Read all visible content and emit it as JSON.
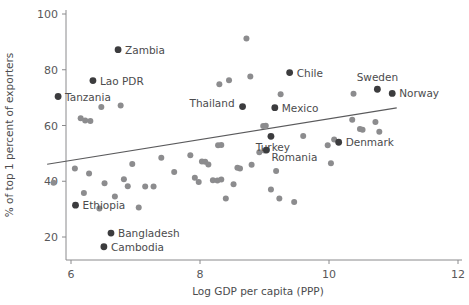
{
  "chart_data": {
    "type": "scatter",
    "title": "",
    "xlabel": "Log GDP per capita (PPP)",
    "ylabel": "% of top 1 percent of exporters",
    "xlim": [
      5.55,
      12.0
    ],
    "ylim": [
      13.5,
      100.0
    ],
    "xticks": [
      6,
      8,
      10,
      12
    ],
    "yticks": [
      20,
      40,
      60,
      80,
      100
    ],
    "grid": false,
    "legend": null,
    "colors": {
      "point_light": "#8c8c8e",
      "point_dark": "#3c3c3e",
      "trendline": "#5a5a5c",
      "axis": "#8a8a8c",
      "text": "#4b4b4d",
      "background": "#ffffff"
    },
    "trendline": {
      "type": "linear-fit",
      "x_start": 5.63,
      "y_start": 46.1,
      "x_end": 11.05,
      "y_end": 66.3
    },
    "labeled_points": [
      {
        "label": "Zambia",
        "x": 6.73,
        "y": 87.2
      },
      {
        "label": "Lao PDR",
        "x": 6.34,
        "y": 76.1
      },
      {
        "label": "Tanzania",
        "x": 5.8,
        "y": 70.4
      },
      {
        "label": "Thailand",
        "x": 8.66,
        "y": 66.8
      },
      {
        "label": "Chile",
        "x": 9.39,
        "y": 79.0
      },
      {
        "label": "Sweden",
        "x": 10.75,
        "y": 73.0
      },
      {
        "label": "Norway",
        "x": 10.98,
        "y": 71.5
      },
      {
        "label": "Mexico",
        "x": 9.16,
        "y": 66.4
      },
      {
        "label": "Denmark",
        "x": 10.15,
        "y": 54.0
      },
      {
        "label": "Turkey",
        "x": 9.1,
        "y": 56.1
      },
      {
        "label": "Romania",
        "x": 9.03,
        "y": 51.2
      },
      {
        "label": "Ethiopia",
        "x": 6.07,
        "y": 31.4
      },
      {
        "label": "Bangladesh",
        "x": 6.62,
        "y": 21.4
      },
      {
        "label": "Cambodia",
        "x": 6.51,
        "y": 16.5
      }
    ],
    "unlabeled_points": [
      {
        "x": 6.47,
        "y": 66.6
      },
      {
        "x": 6.77,
        "y": 67.2
      },
      {
        "x": 6.15,
        "y": 62.6
      },
      {
        "x": 6.22,
        "y": 61.8
      },
      {
        "x": 6.3,
        "y": 61.6
      },
      {
        "x": 5.73,
        "y": 39.5
      },
      {
        "x": 6.06,
        "y": 44.6
      },
      {
        "x": 6.28,
        "y": 42.8
      },
      {
        "x": 6.2,
        "y": 35.8
      },
      {
        "x": 6.52,
        "y": 39.3
      },
      {
        "x": 6.44,
        "y": 30.2
      },
      {
        "x": 6.68,
        "y": 34.5
      },
      {
        "x": 6.82,
        "y": 40.7
      },
      {
        "x": 6.88,
        "y": 38.2
      },
      {
        "x": 6.95,
        "y": 46.2
      },
      {
        "x": 7.05,
        "y": 30.6
      },
      {
        "x": 7.15,
        "y": 38.1
      },
      {
        "x": 7.28,
        "y": 38.1
      },
      {
        "x": 7.4,
        "y": 48.4
      },
      {
        "x": 7.6,
        "y": 43.3
      },
      {
        "x": 7.85,
        "y": 49.3
      },
      {
        "x": 7.92,
        "y": 41.3
      },
      {
        "x": 7.98,
        "y": 39.7
      },
      {
        "x": 8.03,
        "y": 47.1
      },
      {
        "x": 8.08,
        "y": 47.0
      },
      {
        "x": 8.13,
        "y": 46.0
      },
      {
        "x": 8.2,
        "y": 40.4
      },
      {
        "x": 8.27,
        "y": 40.3
      },
      {
        "x": 8.33,
        "y": 40.6
      },
      {
        "x": 8.28,
        "y": 52.9
      },
      {
        "x": 8.33,
        "y": 53.0
      },
      {
        "x": 8.3,
        "y": 74.8
      },
      {
        "x": 8.4,
        "y": 33.8
      },
      {
        "x": 8.45,
        "y": 76.2
      },
      {
        "x": 8.52,
        "y": 38.9
      },
      {
        "x": 8.58,
        "y": 44.8
      },
      {
        "x": 8.62,
        "y": 44.6
      },
      {
        "x": 8.72,
        "y": 91.2
      },
      {
        "x": 8.78,
        "y": 77.6
      },
      {
        "x": 8.8,
        "y": 45.9
      },
      {
        "x": 8.92,
        "y": 50.4
      },
      {
        "x": 8.98,
        "y": 59.8
      },
      {
        "x": 9.02,
        "y": 59.9
      },
      {
        "x": 9.0,
        "y": 51.0
      },
      {
        "x": 9.1,
        "y": 37.0
      },
      {
        "x": 9.25,
        "y": 71.2
      },
      {
        "x": 9.18,
        "y": 43.7
      },
      {
        "x": 9.23,
        "y": 33.8
      },
      {
        "x": 9.46,
        "y": 32.6
      },
      {
        "x": 9.6,
        "y": 56.2
      },
      {
        "x": 9.98,
        "y": 52.9
      },
      {
        "x": 10.03,
        "y": 46.5
      },
      {
        "x": 10.08,
        "y": 55.0
      },
      {
        "x": 10.38,
        "y": 71.4
      },
      {
        "x": 10.36,
        "y": 62.1
      },
      {
        "x": 10.48,
        "y": 58.7
      },
      {
        "x": 10.52,
        "y": 58.5
      },
      {
        "x": 10.72,
        "y": 61.3
      },
      {
        "x": 10.78,
        "y": 57.8
      }
    ]
  }
}
